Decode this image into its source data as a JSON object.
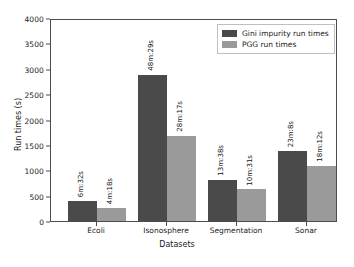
{
  "chart_data": {
    "type": "bar",
    "title": "",
    "xlabel": "Datasets",
    "ylabel": "Run times (s)",
    "ylim": [
      0,
      4000
    ],
    "yticks": [
      0,
      500,
      1000,
      1500,
      2000,
      2500,
      3000,
      3500,
      4000
    ],
    "ytick_labels": [
      "0",
      "500",
      "1000",
      "1500",
      "2000",
      "2500",
      "3000",
      "3500",
      "4000"
    ],
    "grid": false,
    "legend_position": "upper right",
    "categories": [
      "Ecoli",
      "Isonosphere",
      "Segmentation",
      "Sonar"
    ],
    "series": [
      {
        "name": "Gini impurity run times",
        "color": "#4a4a4a",
        "values": [
          392,
          2909,
          818,
          1388
        ],
        "labels": [
          "6m:32s",
          "48m:29s",
          "13m:38s",
          "23m:8s"
        ]
      },
      {
        "name": "PGG run times",
        "color": "#9a9a9a",
        "values": [
          258,
          1697,
          631,
          1092
        ],
        "labels": [
          "4m:18s",
          "28m:17s",
          "10m:31s",
          "18m:12s"
        ]
      }
    ]
  },
  "axes": {
    "ylabel": "Run times (s)",
    "xlabel": "Datasets",
    "ytick_labels": [
      "4000",
      "3500",
      "3000",
      "2500",
      "2000",
      "1500",
      "1000",
      "500",
      "0"
    ],
    "xtick_labels": [
      "Ecoli",
      "Isonosphere",
      "Segmentation",
      "Sonar"
    ]
  },
  "legend": {
    "items": [
      {
        "label": "Gini impurity run times",
        "color": "#4a4a4a"
      },
      {
        "label": "PGG run times",
        "color": "#9a9a9a"
      }
    ]
  },
  "bar_labels": {
    "ecoli_gini": "6m:32s",
    "ecoli_pgg": "4m:18s",
    "isonosphere_gini": "48m:29s",
    "isonosphere_pgg": "28m:17s",
    "segmentation_gini": "13m:38s",
    "segmentation_pgg": "10m:31s",
    "sonar_gini": "23m:8s",
    "sonar_pgg": "18m:12s"
  }
}
